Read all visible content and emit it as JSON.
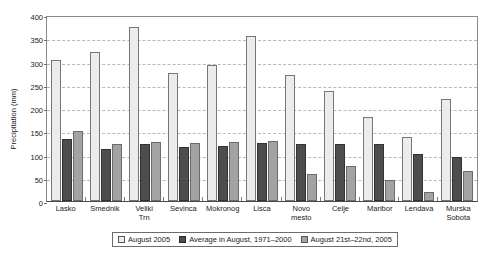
{
  "chart_data": {
    "type": "bar",
    "title": "",
    "xlabel": "",
    "ylabel": "Precipitation (mm)",
    "ylim": [
      0,
      400
    ],
    "ytick_step": 50,
    "yticks": [
      0,
      50,
      100,
      150,
      200,
      250,
      300,
      350,
      400
    ],
    "grid": true,
    "legend_position": "bottom",
    "categories": [
      "Lasko",
      "Smednik",
      "Veliki Trn",
      "Sevinca",
      "Mokronog",
      "Lisca",
      "Novo mesto",
      "Celje",
      "Maribor",
      "Lendava",
      "Murska Sobota"
    ],
    "series": [
      {
        "name": "August 2005",
        "color": "#ececec",
        "values": [
          303,
          320,
          375,
          276,
          293,
          354,
          271,
          237,
          181,
          138,
          219
        ]
      },
      {
        "name": "Average in August, 1971–2000",
        "color": "#4d4d4d",
        "values": [
          134,
          112,
          122,
          117,
          118,
          124,
          123,
          123,
          122,
          102,
          95
        ]
      },
      {
        "name": "August 21st–22nd, 2005",
        "color": "#a3a3a3",
        "values": [
          151,
          123,
          126,
          124,
          126,
          129,
          58,
          75,
          46,
          20,
          65
        ]
      }
    ]
  },
  "legend": {
    "items": [
      "August 2005",
      "Average in August, 1971–2000",
      "August 21st–22nd, 2005"
    ]
  }
}
